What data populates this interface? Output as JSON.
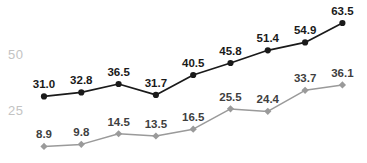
{
  "chart_data": {
    "type": "line",
    "title": "",
    "subtitle": "",
    "xlabel": "",
    "ylabel": "",
    "x": [
      1,
      2,
      3,
      4,
      5,
      6,
      7,
      8,
      9
    ],
    "categories": [
      "1",
      "2",
      "3",
      "4",
      "5",
      "6",
      "7",
      "8",
      "9"
    ],
    "ytick_labels": [
      "50",
      "25"
    ],
    "ytick_values": [
      50,
      25
    ],
    "ylim": [
      0,
      70
    ],
    "xlim": [
      0.5,
      9.5
    ],
    "grid": false,
    "legend": "none",
    "series": [
      {
        "name": "upper",
        "color": "#1a1a1a",
        "marker": "circle",
        "values": [
          31.0,
          32.8,
          36.5,
          31.7,
          40.5,
          45.8,
          51.4,
          54.9,
          63.5
        ],
        "labels": [
          "31.0",
          "32.8",
          "36.5",
          "31.7",
          "40.5",
          "45.8",
          "51.4",
          "54.9",
          "63.5"
        ]
      },
      {
        "name": "lower",
        "color": "#9a9a9a",
        "marker": "diamond",
        "values": [
          8.9,
          9.8,
          14.5,
          13.5,
          16.5,
          25.5,
          24.4,
          33.7,
          36.1
        ],
        "labels": [
          "8.9",
          "9.8",
          "14.5",
          "13.5",
          "16.5",
          "25.5",
          "24.4",
          "33.7",
          "36.1"
        ]
      }
    ]
  },
  "colors": {
    "background": "#ffffff",
    "series_upper": "#1a1a1a",
    "series_lower": "#9a9a9a",
    "axis_label": "#c3c3c3",
    "label_upper": "#1a1a1a",
    "label_lower": "#3f3f3f"
  }
}
